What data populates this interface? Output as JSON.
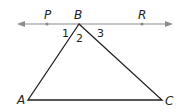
{
  "diagram": {
    "type": "geometry",
    "line": {
      "arrow_color": "#8c8c8c",
      "points": [
        "P",
        "B",
        "R"
      ]
    },
    "triangle": {
      "vertices": [
        "A",
        "B",
        "C"
      ],
      "stroke": "#231f20"
    },
    "labels": {
      "P": "P",
      "B": "B",
      "R": "R",
      "A": "A",
      "C": "C"
    },
    "angles": {
      "angle1": "1",
      "angle2": "2",
      "angle3": "3"
    }
  }
}
